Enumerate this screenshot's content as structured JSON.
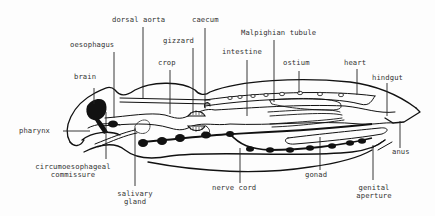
{
  "diagram": {
    "colors": {
      "ink": "#111111",
      "label": "#333333",
      "background": "#fdfdfd"
    },
    "labels": {
      "dorsal_aorta": "dorsal aorta",
      "caecum": "caecum",
      "oesophagus": "oesophagus",
      "gizzard": "gizzard",
      "malpighian_tubule": "Malpighian tubule",
      "crop": "crop",
      "intestine": "intestine",
      "ostium": "ostium",
      "heart": "heart",
      "brain": "brain",
      "hindgut": "hindgut",
      "pharynx": "pharynx",
      "circumoesophageal_line1": "circumoesophageal",
      "circumoesophageal_line2": "commissure",
      "anus": "anus",
      "gonad": "gonad",
      "salivary_line1": "salivary",
      "salivary_line2": "gland",
      "nerve_cord": "nerve cord",
      "genital_line1": "genital",
      "genital_line2": "aperture"
    }
  }
}
